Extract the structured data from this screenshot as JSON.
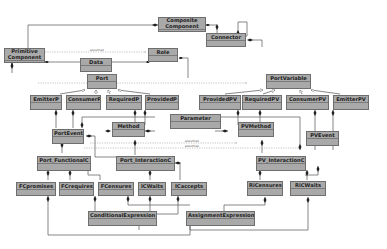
{
  "diagram": {
    "type": "uml-class-diagram",
    "classes": {
      "composite_component": "Composite\nComponent",
      "connector": "Connector",
      "primitive_component": "Primitive\nComponent",
      "data": "Data",
      "role": "Role",
      "port": "Port",
      "port_variable": "PortVariable",
      "emitter_p": "EmitterP",
      "consumer_p": "ConsumerP",
      "required_p": "RequiredP",
      "provided_p": "ProvidedP",
      "provided_pv": "ProvidedPV",
      "required_pv": "RequiredPV",
      "consumer_pv": "ConsumerPV",
      "emitter_pv": "EmitterPV",
      "parameter": "Parameter",
      "port_event": "PortEvent",
      "method": "Method",
      "pv_method": "PVMethod",
      "pv_event": "PVEvent",
      "port_functional_c": "Port_FunctionalC",
      "port_interaction_c": "Port_InteractionC",
      "pv_interaction_c": "PV_InteractionC",
      "fc_promises": "FCpromises",
      "fc_requires": "FCrequires",
      "fc_censures": "FCensures",
      "ic_waits": "ICWaits",
      "ic_accepts": "ICaccepts",
      "ri_censures": "RiCensures",
      "ric_waits": "RiCWaits",
      "conditional_expression": "ConditionalExpression",
      "assignment_expression": "AssignmentExpression"
    },
    "relation_labels": {
      "assumes": "assumes"
    },
    "colors": {
      "class_fill": "#a9a9a9",
      "class_border": "#6e6e6e",
      "line": "#555555",
      "dashed_line": "#888888"
    }
  }
}
